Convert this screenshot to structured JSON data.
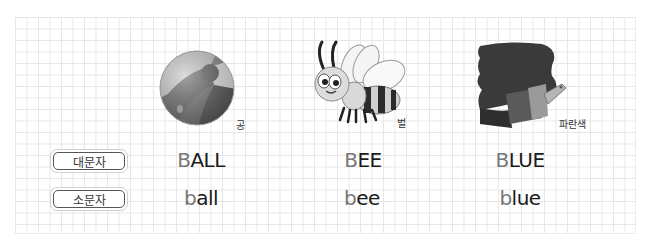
{
  "labels": {
    "uppercase": "대문자",
    "lowercase": "소문자"
  },
  "items": [
    {
      "image_icon": "beach-ball-icon",
      "caption": "공",
      "upper": {
        "first": "B",
        "rest": "ALL"
      },
      "lower": {
        "first": "b",
        "rest": "all"
      }
    },
    {
      "image_icon": "bee-icon",
      "caption": "벌",
      "upper": {
        "first": "B",
        "rest": "EE"
      },
      "lower": {
        "first": "b",
        "rest": "ee"
      }
    },
    {
      "image_icon": "blue-paint-brush-icon",
      "caption": "파란색",
      "upper": {
        "first": "B",
        "rest": "LUE"
      },
      "lower": {
        "first": "b",
        "rest": "lue"
      }
    }
  ],
  "colors": {
    "first_letter": "#777777",
    "rest_letters": "#1a1a1a",
    "grid": "#e6e6e6"
  }
}
